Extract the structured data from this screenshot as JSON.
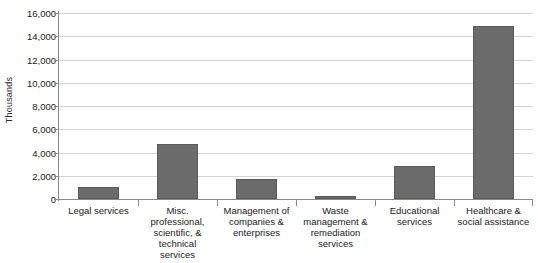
{
  "chart_data": {
    "type": "bar",
    "title": "",
    "subtitle": "",
    "xlabel": "",
    "ylabel": "Thousands",
    "categories": [
      "Legal services",
      "Misc. professional, scientific, & technical services",
      "Management of companies & enterprises",
      "Waste management & remediation services",
      "Educational services",
      "Healthcare & social assistance"
    ],
    "category_lines": [
      [
        "Legal services"
      ],
      [
        "Misc.",
        "professional,",
        "scientific, &",
        "technical",
        "services"
      ],
      [
        "Management of",
        "companies &",
        "enterprises"
      ],
      [
        "Waste",
        "management &",
        "remediation",
        "services"
      ],
      [
        "Educational",
        "services"
      ],
      [
        "Healthcare &",
        "social assistance"
      ]
    ],
    "values": [
      1050,
      4750,
      1700,
      300,
      2800,
      14900
    ],
    "ylim": [
      0,
      16000
    ],
    "ytick_values": [
      0,
      2000,
      4000,
      6000,
      8000,
      10000,
      12000,
      14000,
      16000
    ],
    "ytick_labels": [
      "0",
      "2,000",
      "4,000",
      "6,000",
      "8,000",
      "10,000",
      "12,000",
      "14,000",
      "16,000"
    ],
    "grid": true,
    "legend": false,
    "legend_position": "none",
    "series": [
      {
        "name": "Employment",
        "values": [
          1050,
          4750,
          1700,
          300,
          2800,
          14900
        ]
      }
    ]
  },
  "style": {
    "bar_color": "#6b6b6b",
    "bar_border_color": "#5a5a5a",
    "grid_color": "#d4d4d4",
    "axis_color": "#8a8a8a",
    "text_color": "#1a1a1a",
    "background": "#ffffff"
  }
}
